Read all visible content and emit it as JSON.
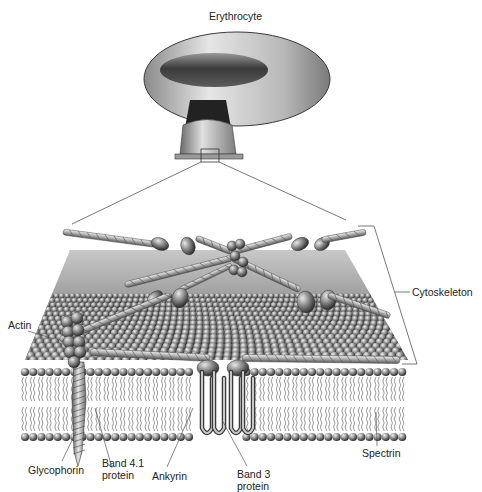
{
  "figure": {
    "title": "Erythrocyte",
    "labels": {
      "cytoskeleton": "Cytoskeleton",
      "actin": "Actin",
      "glycophorin": "Glycophorin",
      "band41_line1": "Band 4.1",
      "band41_line2": "protein",
      "ankyrin": "Ankyrin",
      "band3_line1": "Band 3",
      "band3_line2": "protein",
      "spectrin": "Spectrin"
    },
    "components": [
      "erythrocyte-cell",
      "zoom-box",
      "cytoskeleton-layer",
      "spectrin-filaments",
      "actin-cluster",
      "lipid-bilayer",
      "glycophorin",
      "band3-protein",
      "ankyrin",
      "band41-protein"
    ],
    "colors": {
      "ink": "#222222",
      "leader": "#555555",
      "sphere_light": "#d8d8d8",
      "sphere_dark": "#3c3c3c",
      "filament": "#bdbdbd",
      "cell_light": "#e2e2e2",
      "cell_dark": "#4a4a4a"
    }
  }
}
